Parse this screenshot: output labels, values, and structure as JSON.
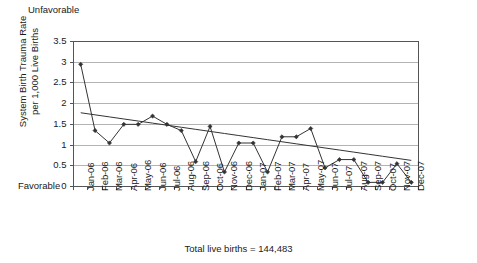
{
  "annotations": {
    "top_label": "Unfavorable",
    "bottom_label": "Favorable",
    "footer_note": "Total live births = 144,483"
  },
  "axis_title": {
    "line1": "System Birth Trauma Rate",
    "line2": "per 1,000 Live Births"
  },
  "chart_data": {
    "type": "line",
    "title": "",
    "subtitle": "",
    "xlabel": "",
    "ylabel": "System Birth Trauma Rate per 1,000 Live Births",
    "ylim": [
      0,
      3.5
    ],
    "yticks": [
      0,
      0.5,
      1,
      1.5,
      2,
      2.5,
      3,
      3.5
    ],
    "ytick_labels": [
      "0",
      "0.5",
      "1",
      "1.5",
      "2",
      "2.5",
      "3",
      "3.5"
    ],
    "grid": true,
    "legend": false,
    "legend_position": "none",
    "categories": [
      "Jan-06",
      "Feb-06",
      "Mar-06",
      "Apr-06",
      "May-06",
      "Jun-06",
      "Jul-06",
      "Aug-06",
      "Sep-06",
      "Oct-06",
      "Nov-06",
      "Dec-06",
      "Jan-07",
      "Feb-07",
      "Mar-07",
      "Apr-07",
      "May-07",
      "Jun-07",
      "Jul-07",
      "Aug-07",
      "Sep-07",
      "Oct-07",
      "Nov-07",
      "Dec-07"
    ],
    "series": [
      {
        "name": "System Birth Trauma Rate",
        "type": "line",
        "marker": "diamond",
        "color": "#333333",
        "values": [
          2.95,
          1.35,
          1.05,
          1.5,
          1.5,
          1.7,
          1.5,
          1.35,
          0.6,
          1.45,
          0.35,
          1.05,
          1.05,
          0.35,
          1.2,
          1.2,
          1.4,
          0.45,
          0.65,
          0.65,
          0.1,
          0.1,
          0.55,
          0.1
        ]
      },
      {
        "name": "Linear trend",
        "type": "trendline",
        "marker": "none",
        "color": "#333333",
        "values": [
          1.78,
          1.73,
          1.68,
          1.63,
          1.58,
          1.53,
          1.48,
          1.43,
          1.38,
          1.33,
          1.28,
          1.23,
          1.18,
          1.13,
          1.08,
          1.03,
          0.98,
          0.93,
          0.88,
          0.83,
          0.78,
          0.73,
          0.68,
          0.63
        ]
      }
    ]
  },
  "colors": {
    "line": "#333333",
    "grid": "#b3b3b3",
    "axis": "#555555",
    "text": "#1a1a1a",
    "background": "#ffffff"
  }
}
